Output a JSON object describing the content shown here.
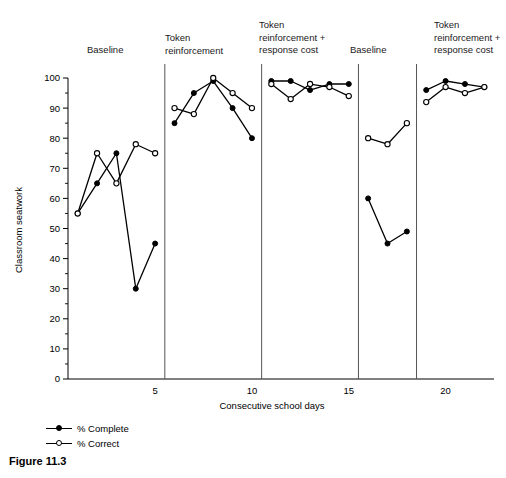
{
  "figure": {
    "caption": "Figure 11.3"
  },
  "legend": {
    "position": "below-axis-left",
    "entries": [
      {
        "label": "% Complete",
        "marker": "filled-circle-marker",
        "color": "#000000"
      },
      {
        "label": "% Correct",
        "marker": "open-circle-marker",
        "color": "#000000"
      }
    ]
  },
  "chart_data": {
    "type": "line",
    "title": "",
    "subtitle": "",
    "xlabel": "Consecutive school days",
    "ylabel": "Classroom seatwork",
    "xlim": [
      0.5,
      22.5
    ],
    "ylim": [
      0,
      100
    ],
    "xticks": [
      5,
      10,
      15,
      20
    ],
    "xtick_labels": [
      "5",
      "10",
      "15",
      "20"
    ],
    "yticks": [
      0,
      10,
      20,
      30,
      40,
      50,
      60,
      70,
      80,
      90,
      100
    ],
    "ytick_labels": [
      "0",
      "10",
      "20",
      "30",
      "40",
      "50",
      "60",
      "70",
      "80",
      "90",
      "100"
    ],
    "y_minor_tick_step": 5,
    "grid": false,
    "legend_position": "below",
    "series": [
      {
        "name": "% Complete",
        "marker": "filled-circle",
        "color": "#000000",
        "points": [
          {
            "x": 1,
            "y": 55
          },
          {
            "x": 2,
            "y": 65
          },
          {
            "x": 3,
            "y": 75
          },
          {
            "x": 4,
            "y": 30
          },
          {
            "x": 5,
            "y": 45
          },
          {
            "x": 6,
            "y": 85
          },
          {
            "x": 7,
            "y": 95
          },
          {
            "x": 8,
            "y": 99
          },
          {
            "x": 9,
            "y": 90
          },
          {
            "x": 10,
            "y": 80
          },
          {
            "x": 11,
            "y": 99
          },
          {
            "x": 12,
            "y": 99
          },
          {
            "x": 13,
            "y": 96
          },
          {
            "x": 14,
            "y": 98
          },
          {
            "x": 15,
            "y": 98
          },
          {
            "x": 16,
            "y": 60
          },
          {
            "x": 17,
            "y": 45
          },
          {
            "x": 18,
            "y": 49
          },
          {
            "x": 19,
            "y": 96
          },
          {
            "x": 20,
            "y": 99
          },
          {
            "x": 21,
            "y": 98
          },
          {
            "x": 22,
            "y": 97
          }
        ]
      },
      {
        "name": "% Correct",
        "marker": "open-circle",
        "color": "#000000",
        "points": [
          {
            "x": 1,
            "y": 55
          },
          {
            "x": 2,
            "y": 75
          },
          {
            "x": 3,
            "y": 65
          },
          {
            "x": 4,
            "y": 78
          },
          {
            "x": 5,
            "y": 75
          },
          {
            "x": 6,
            "y": 90
          },
          {
            "x": 7,
            "y": 88
          },
          {
            "x": 8,
            "y": 100
          },
          {
            "x": 9,
            "y": 95
          },
          {
            "x": 10,
            "y": 90
          },
          {
            "x": 11,
            "y": 98
          },
          {
            "x": 12,
            "y": 93
          },
          {
            "x": 13,
            "y": 98
          },
          {
            "x": 14,
            "y": 97
          },
          {
            "x": 15,
            "y": 94
          },
          {
            "x": 16,
            "y": 80
          },
          {
            "x": 17,
            "y": 78
          },
          {
            "x": 18,
            "y": 85
          },
          {
            "x": 19,
            "y": 92
          },
          {
            "x": 20,
            "y": 97
          },
          {
            "x": 21,
            "y": 95
          },
          {
            "x": 22,
            "y": 97
          }
        ]
      }
    ],
    "phases": [
      {
        "label": "Baseline",
        "start_x": 0.5,
        "end_x": 5.5,
        "label_x": 3.0
      },
      {
        "label": "Token\nreinforcement",
        "start_x": 5.5,
        "end_x": 10.5,
        "label_x": 6.2
      },
      {
        "label": "Token\nreinforcement +\nresponse cost",
        "start_x": 10.5,
        "end_x": 15.5,
        "label_x": 11.2
      },
      {
        "label": "Baseline",
        "start_x": 15.5,
        "end_x": 18.5,
        "label_x": 16.2
      },
      {
        "label": "Token\nreinforcement +\nresponse cost",
        "start_x": 18.5,
        "end_x": 22.5,
        "label_x": 19.2
      }
    ],
    "phase_dividers": [
      5.5,
      10.5,
      15.5,
      18.5
    ]
  }
}
